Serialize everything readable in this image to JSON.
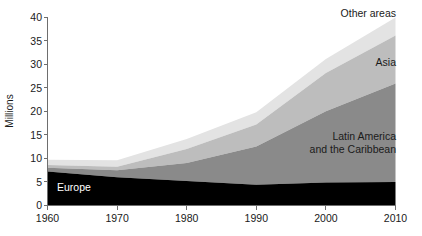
{
  "chart_data": {
    "type": "area",
    "title": "",
    "subtitle": "",
    "xlabel": "",
    "ylabel": "Millions",
    "stacked": true,
    "grid": false,
    "legend_position": "inline-annotations",
    "x": [
      1960,
      1970,
      1980,
      1990,
      2000,
      2010
    ],
    "xtick_labels": [
      "1960",
      "1970",
      "1980",
      "1990",
      "2000",
      "2010"
    ],
    "ytick_labels": [
      "0",
      "5",
      "10",
      "15",
      "20",
      "25",
      "30",
      "35",
      "40"
    ],
    "ytick_values": [
      0,
      5,
      10,
      15,
      20,
      25,
      30,
      35,
      40
    ],
    "xlim": [
      1960,
      2010
    ],
    "ylim": [
      0,
      40
    ],
    "series": [
      {
        "name": "Europe",
        "color": "#000000",
        "label_color": "#ffffff",
        "values": [
          7.2,
          6.0,
          5.2,
          4.4,
          4.9,
          5.0
        ]
      },
      {
        "name": "Latin America and the Caribbean",
        "color": "#8a8a8a",
        "label_color": "#1a1a1a",
        "values": [
          0.8,
          1.5,
          3.8,
          8.1,
          15.1,
          20.9
        ]
      },
      {
        "name": "Asia",
        "color": "#bdbdbd",
        "label_color": "#1a1a1a",
        "values": [
          0.6,
          0.7,
          3.0,
          4.7,
          8.1,
          10.2
        ]
      },
      {
        "name": "Other areas",
        "color": "#e3e3e3",
        "label_color": "#1a1a1a",
        "values": [
          1.1,
          1.4,
          2.1,
          2.6,
          3.0,
          3.8
        ]
      }
    ],
    "cumulative_tops": {
      "Europe": [
        7.2,
        6.0,
        5.2,
        4.4,
        4.9,
        5.0
      ],
      "Latin America and the Caribbean": [
        8.0,
        7.5,
        9.0,
        12.5,
        20.0,
        25.9
      ],
      "Asia": [
        8.6,
        8.2,
        12.0,
        17.2,
        28.1,
        36.1
      ],
      "Other areas": [
        9.7,
        9.6,
        14.1,
        19.8,
        31.1,
        39.9
      ]
    },
    "annotations": [
      {
        "text": "Other areas",
        "series": "Other areas"
      },
      {
        "text": "Asia",
        "series": "Asia"
      },
      {
        "text": "Latin America",
        "series": "Latin America and the Caribbean"
      },
      {
        "text": "and the Caribbean",
        "series": "Latin America and the Caribbean"
      },
      {
        "text": "Europe",
        "series": "Europe"
      }
    ]
  },
  "labels": {
    "y_axis_title": "Millions",
    "europe": "Europe",
    "latin_america_line1": "Latin America",
    "latin_america_line2": "and the Caribbean",
    "asia": "Asia",
    "other_areas": "Other areas"
  },
  "yticks": {
    "t0": "0",
    "t5": "5",
    "t10": "10",
    "t15": "15",
    "t20": "20",
    "t25": "25",
    "t30": "30",
    "t35": "35",
    "t40": "40"
  },
  "xticks": {
    "t1960": "1960",
    "t1970": "1970",
    "t1980": "1980",
    "t1990": "1990",
    "t2000": "2000",
    "t2010": "2010"
  }
}
